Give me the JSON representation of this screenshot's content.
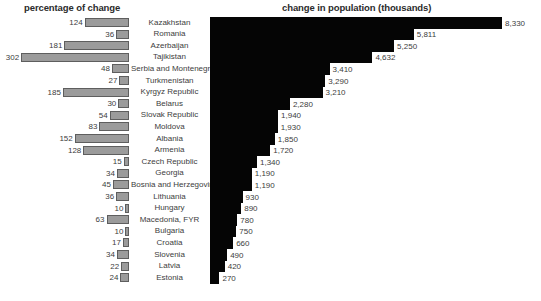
{
  "titles": {
    "left": "percentage of change",
    "right": "change in population (thousands)"
  },
  "chart_data": [
    {
      "type": "bar",
      "title": "percentage of change",
      "orientation": "horizontal-left",
      "xlabel": "",
      "ylabel": "",
      "grid": false,
      "legend": false,
      "xlim": [
        0,
        302
      ],
      "categories": [
        "Kazakhstan",
        "Romania",
        "Azerbaijan",
        "Tajikistan",
        "Serbia and Montenegro",
        "Turkmenistan",
        "Kyrgyz Republic",
        "Belarus",
        "Slovak Republic",
        "Moldova",
        "Albania",
        "Armenia",
        "Czech Republic",
        "Georgia",
        "Bosnia and Herzegovina",
        "Lithuania",
        "Hungary",
        "Macedonia, FYR",
        "Bulgaria",
        "Croatia",
        "Slovenia",
        "Latvia",
        "Estonia"
      ],
      "values": [
        124,
        36,
        181,
        302,
        48,
        27,
        185,
        30,
        54,
        83,
        152,
        128,
        15,
        34,
        45,
        36,
        10,
        63,
        10,
        17,
        34,
        22,
        24
      ]
    },
    {
      "type": "bar",
      "title": "change in population (thousands)",
      "orientation": "horizontal-right",
      "xlabel": "",
      "ylabel": "",
      "grid": false,
      "legend": false,
      "xlim": [
        0,
        8330
      ],
      "categories": [
        "Kazakhstan",
        "Romania",
        "Azerbaijan",
        "Tajikistan",
        "Serbia and Montenegro",
        "Turkmenistan",
        "Kyrgyz Republic",
        "Belarus",
        "Slovak Republic",
        "Moldova",
        "Albania",
        "Armenia",
        "Czech Republic",
        "Georgia",
        "Bosnia and Herzegovina",
        "Lithuania",
        "Hungary",
        "Macedonia, FYR",
        "Bulgaria",
        "Croatia",
        "Slovenia",
        "Latvia",
        "Estonia"
      ],
      "values": [
        8330,
        5811,
        5250,
        4632,
        3410,
        3290,
        3210,
        2280,
        1940,
        1930,
        1850,
        1720,
        1340,
        1190,
        1190,
        930,
        890,
        780,
        750,
        660,
        490,
        420,
        270
      ]
    }
  ],
  "rows": [
    {
      "country": "Kazakhstan",
      "pct": 124,
      "pct_label": "124",
      "pop": 8330,
      "pop_label": "8,330"
    },
    {
      "country": "Romania",
      "pct": 36,
      "pct_label": "36",
      "pop": 5811,
      "pop_label": "5,811"
    },
    {
      "country": "Azerbaijan",
      "pct": 181,
      "pct_label": "181",
      "pop": 5250,
      "pop_label": "5,250"
    },
    {
      "country": "Tajikistan",
      "pct": 302,
      "pct_label": "302",
      "pop": 4632,
      "pop_label": "4,632"
    },
    {
      "country": "Serbia and Montenegro",
      "pct": 48,
      "pct_label": "48",
      "pop": 3410,
      "pop_label": "3,410"
    },
    {
      "country": "Turkmenistan",
      "pct": 27,
      "pct_label": "27",
      "pop": 3290,
      "pop_label": "3,290"
    },
    {
      "country": "Kyrgyz Republic",
      "pct": 185,
      "pct_label": "185",
      "pop": 3210,
      "pop_label": "3,210"
    },
    {
      "country": "Belarus",
      "pct": 30,
      "pct_label": "30",
      "pop": 2280,
      "pop_label": "2,280"
    },
    {
      "country": "Slovak Republic",
      "pct": 54,
      "pct_label": "54",
      "pop": 1940,
      "pop_label": "1,940"
    },
    {
      "country": "Moldova",
      "pct": 83,
      "pct_label": "83",
      "pop": 1930,
      "pop_label": "1,930"
    },
    {
      "country": "Albania",
      "pct": 152,
      "pct_label": "152",
      "pop": 1850,
      "pop_label": "1,850"
    },
    {
      "country": "Armenia",
      "pct": 128,
      "pct_label": "128",
      "pop": 1720,
      "pop_label": "1,720"
    },
    {
      "country": "Czech Republic",
      "pct": 15,
      "pct_label": "15",
      "pop": 1340,
      "pop_label": "1,340"
    },
    {
      "country": "Georgia",
      "pct": 34,
      "pct_label": "34",
      "pop": 1190,
      "pop_label": "1,190"
    },
    {
      "country": "Bosnia and Herzegovina",
      "pct": 45,
      "pct_label": "45",
      "pop": 1190,
      "pop_label": "1,190"
    },
    {
      "country": "Lithuania",
      "pct": 36,
      "pct_label": "36",
      "pop": 930,
      "pop_label": "930"
    },
    {
      "country": "Hungary",
      "pct": 10,
      "pct_label": "10",
      "pop": 890,
      "pop_label": "890"
    },
    {
      "country": "Macedonia, FYR",
      "pct": 63,
      "pct_label": "63",
      "pop": 780,
      "pop_label": "780"
    },
    {
      "country": "Bulgaria",
      "pct": 10,
      "pct_label": "10",
      "pop": 750,
      "pop_label": "750"
    },
    {
      "country": "Croatia",
      "pct": 17,
      "pct_label": "17",
      "pop": 660,
      "pop_label": "660"
    },
    {
      "country": "Slovenia",
      "pct": 34,
      "pct_label": "34",
      "pop": 490,
      "pop_label": "490"
    },
    {
      "country": "Latvia",
      "pct": 22,
      "pct_label": "22",
      "pop": 420,
      "pop_label": "420"
    },
    {
      "country": "Estonia",
      "pct": 24,
      "pct_label": "24",
      "pop": 270,
      "pop_label": "270"
    }
  ],
  "colors": {
    "left_bar_fill": "#9b9b9b",
    "left_bar_border": "#5e5e5e",
    "right_bar_fill": "#050505",
    "text": "#3d3d3d",
    "title": "#2b2b2b",
    "background": "#ffffff"
  },
  "geometry": {
    "left_baseline_x": 129,
    "left_px_per_unit": 0.357,
    "right_origin_x": 210,
    "right_px_per_unit": 0.03506,
    "row_top": 17,
    "row_height": 11.6
  }
}
